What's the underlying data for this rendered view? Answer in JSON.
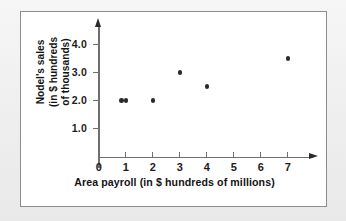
{
  "chart_data": {
    "type": "scatter",
    "title": "",
    "xlabel": "Area payroll (in $ hundreds of millions)",
    "ylabel_lines": [
      "Nodel's sales",
      "(in $ hundreds",
      "of thousands)"
    ],
    "ylabel": "Nodel's sales (in $ hundreds of thousands)",
    "xlim": [
      0,
      7.8
    ],
    "ylim": [
      0,
      4.6
    ],
    "xticks": [
      "0",
      "1",
      "2",
      "3",
      "4",
      "5",
      "6",
      "7"
    ],
    "xtick_values": [
      0,
      1,
      2,
      3,
      4,
      5,
      6,
      7
    ],
    "yticks": [
      "1.0",
      "2.0",
      "3.0",
      "4.0"
    ],
    "ytick_values": [
      1.0,
      2.0,
      3.0,
      4.0
    ],
    "grid": false,
    "legend": null,
    "point_color": "#2a2a2c",
    "axis_color": "#6f6f73",
    "points": [
      {
        "x": 0.85,
        "y": 2.0
      },
      {
        "x": 1.0,
        "y": 2.0
      },
      {
        "x": 2.0,
        "y": 2.0
      },
      {
        "x": 3.0,
        "y": 3.0
      },
      {
        "x": 4.0,
        "y": 2.5
      },
      {
        "x": 7.0,
        "y": 3.5
      }
    ]
  }
}
